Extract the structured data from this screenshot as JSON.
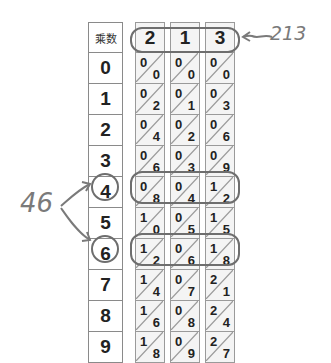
{
  "multiplier_column": {
    "header": "乘数",
    "values": [
      "0",
      "1",
      "2",
      "3",
      "4",
      "5",
      "6",
      "7",
      "8",
      "9"
    ]
  },
  "rods": [
    {
      "digit": "2",
      "cells": [
        [
          "0",
          "0"
        ],
        [
          "0",
          "2"
        ],
        [
          "0",
          "4"
        ],
        [
          "0",
          "6"
        ],
        [
          "0",
          "8"
        ],
        [
          "1",
          "0"
        ],
        [
          "1",
          "2"
        ],
        [
          "1",
          "4"
        ],
        [
          "1",
          "6"
        ],
        [
          "1",
          "8"
        ]
      ]
    },
    {
      "digit": "1",
      "cells": [
        [
          "0",
          "0"
        ],
        [
          "0",
          "1"
        ],
        [
          "0",
          "2"
        ],
        [
          "0",
          "3"
        ],
        [
          "0",
          "4"
        ],
        [
          "0",
          "5"
        ],
        [
          "0",
          "6"
        ],
        [
          "0",
          "7"
        ],
        [
          "0",
          "8"
        ],
        [
          "0",
          "9"
        ]
      ]
    },
    {
      "digit": "3",
      "cells": [
        [
          "0",
          "0"
        ],
        [
          "0",
          "3"
        ],
        [
          "0",
          "6"
        ],
        [
          "0",
          "9"
        ],
        [
          "1",
          "2"
        ],
        [
          "1",
          "5"
        ],
        [
          "1",
          "8"
        ],
        [
          "2",
          "1"
        ],
        [
          "2",
          "4"
        ],
        [
          "2",
          "7"
        ]
      ]
    }
  ],
  "annotations": {
    "multiplicand": "213",
    "multiplier": "46",
    "highlighted_rows": [
      "4",
      "6"
    ]
  },
  "colors": {
    "outline": "#6e6e6e",
    "grid": "#9a9a9a",
    "rod_fill": "#f4f4f4",
    "text": "#222222",
    "handwriting": "#7a7a7a"
  }
}
